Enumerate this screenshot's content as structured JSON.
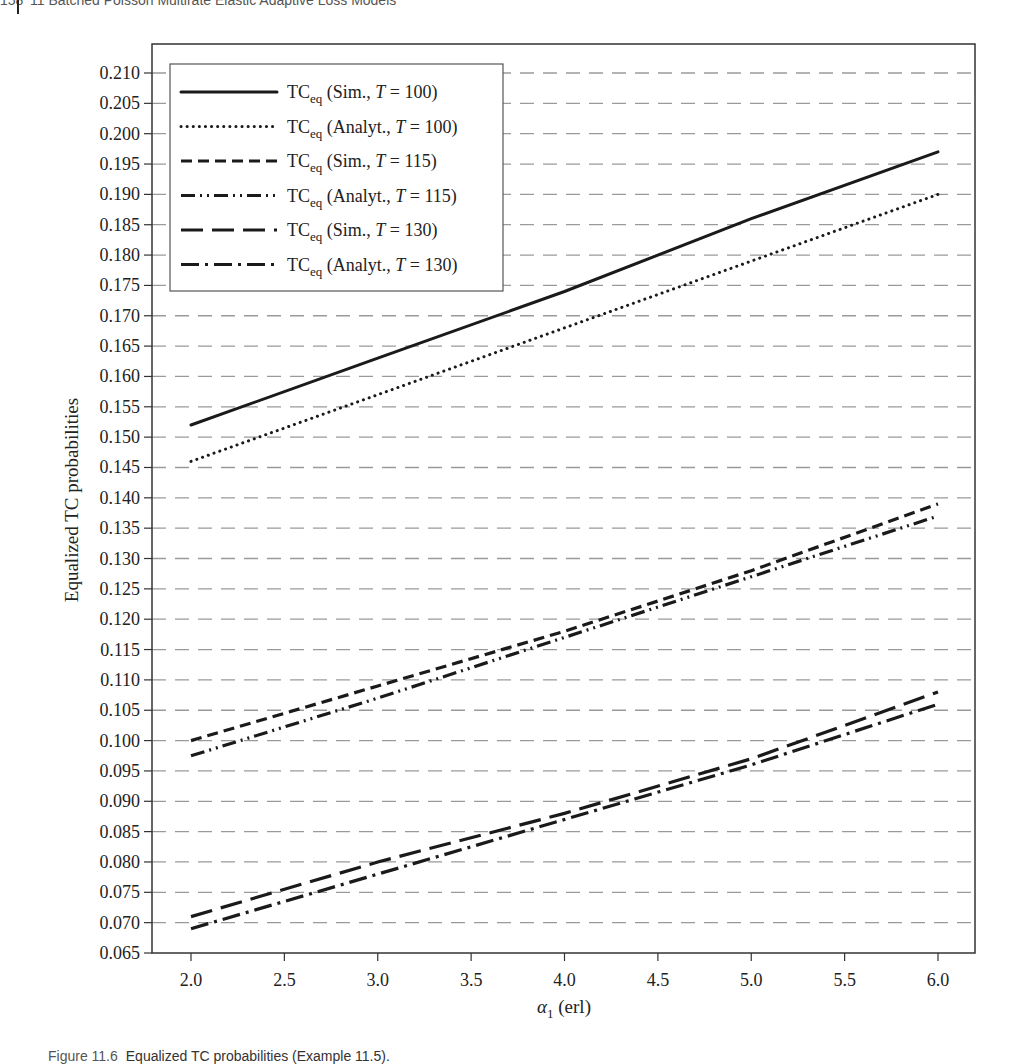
{
  "page": {
    "header": {
      "page_number": "158",
      "running_title": "11 Batched Poisson Multirate Elastic Adaptive Loss Models"
    },
    "caption": {
      "label": "Figure 11.6",
      "text": "Equalized TC probabilities (Example 11.5)."
    }
  },
  "chart_data": {
    "type": "line",
    "title": "",
    "xlabel": "α1 (erl)",
    "ylabel": "Equalized TC probabilities",
    "xlim": [
      1.8,
      6.2
    ],
    "ylim": [
      0.065,
      0.215
    ],
    "x": [
      2.0,
      3.0,
      4.0,
      5.0,
      6.0
    ],
    "x_ticks": [
      "2.0",
      "2.5",
      "3.0",
      "3.5",
      "4.0",
      "4.5",
      "5.0",
      "5.5",
      "6.0"
    ],
    "y_ticks": [
      "0.065",
      "0.070",
      "0.075",
      "0.080",
      "0.085",
      "0.090",
      "0.095",
      "0.100",
      "0.105",
      "0.110",
      "0.115",
      "0.120",
      "0.125",
      "0.130",
      "0.135",
      "0.140",
      "0.145",
      "0.150",
      "0.155",
      "0.160",
      "0.165",
      "0.170",
      "0.175",
      "0.180",
      "0.185",
      "0.190",
      "0.195",
      "0.200",
      "0.205",
      "0.210"
    ],
    "grid": {
      "horizontal": true,
      "style": "dashed",
      "color": "#9a9a9a"
    },
    "legend_position": "upper-left",
    "series": [
      {
        "name": "TCeq (Sim., T = 100)",
        "base": "TC",
        "sub": "eq",
        "method": "Sim.",
        "T": "100",
        "style": "solid",
        "values": [
          0.152,
          0.163,
          0.174,
          0.186,
          0.197
        ]
      },
      {
        "name": "TCeq (Analyt., T = 100)",
        "base": "TC",
        "sub": "eq",
        "method": "Analyt.",
        "T": "100",
        "style": "dotted",
        "values": [
          0.146,
          0.157,
          0.168,
          0.179,
          0.19
        ]
      },
      {
        "name": "TCeq (Sim., T = 115)",
        "base": "TC",
        "sub": "eq",
        "method": "Sim.",
        "T": "115",
        "style": "dashed",
        "values": [
          0.1,
          0.109,
          0.118,
          0.128,
          0.139
        ]
      },
      {
        "name": "TCeq (Analyt., T = 115)",
        "base": "TC",
        "sub": "eq",
        "method": "Analyt.",
        "T": "115",
        "style": "dashdotdot",
        "values": [
          0.0975,
          0.107,
          0.117,
          0.127,
          0.137
        ]
      },
      {
        "name": "TCeq (Sim., T = 130)",
        "base": "TC",
        "sub": "eq",
        "method": "Sim.",
        "T": "130",
        "style": "longdash",
        "values": [
          0.071,
          0.08,
          0.088,
          0.097,
          0.108
        ]
      },
      {
        "name": "TCeq (Analyt., T = 130)",
        "base": "TC",
        "sub": "eq",
        "method": "Analyt.",
        "T": "130",
        "style": "dashdot",
        "values": [
          0.069,
          0.078,
          0.087,
          0.096,
          0.106
        ]
      }
    ]
  },
  "colors": {
    "line": "#1a1a1a",
    "grid": "#9a9a9a",
    "frame": "#333333"
  }
}
